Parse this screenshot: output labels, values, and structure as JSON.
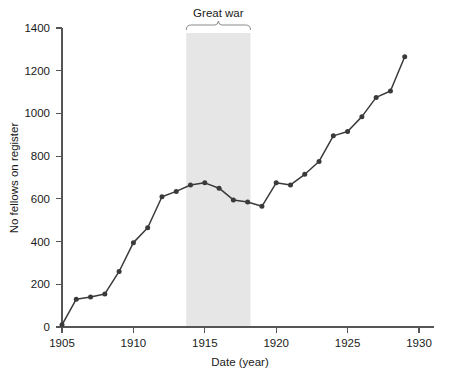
{
  "chart_data": {
    "type": "line",
    "title": "",
    "xlabel": "Date (year)",
    "ylabel": "No fellows on register",
    "xlim": [
      1905,
      1930
    ],
    "ylim": [
      0,
      1400
    ],
    "xticks": [
      1905,
      1910,
      1915,
      1920,
      1925,
      1930
    ],
    "yticks": [
      0,
      200,
      400,
      600,
      800,
      1000,
      1200,
      1400
    ],
    "grid": false,
    "legend": null,
    "x": [
      1905,
      1906,
      1907,
      1908,
      1909,
      1910,
      1911,
      1912,
      1913,
      1914,
      1915,
      1916,
      1917,
      1918,
      1919,
      1920,
      1921,
      1922,
      1923,
      1924,
      1925,
      1926,
      1927,
      1928,
      1929
    ],
    "values": [
      10,
      130,
      140,
      155,
      260,
      395,
      465,
      610,
      635,
      665,
      675,
      650,
      595,
      585,
      565,
      675,
      665,
      715,
      775,
      895,
      915,
      985,
      1075,
      1105,
      1265
    ],
    "marker": "filled-circle",
    "line_color": "#3a3a3a",
    "annotations": [
      {
        "label": "Great war",
        "type": "shaded-band-with-brace",
        "x_start": 1913.7,
        "x_end": 1918.2,
        "band_color": "#e6e6e6"
      }
    ]
  },
  "axis": {
    "y_tick_labels": [
      "0",
      "200",
      "400",
      "600",
      "800",
      "1000",
      "1200",
      "1400"
    ],
    "x_tick_labels": [
      "1905",
      "1910",
      "1915",
      "1920",
      "1925",
      "1930"
    ],
    "x_title": "Date (year)",
    "y_title": "No fellows on register"
  },
  "annotation": {
    "great_war_label": "Great war"
  }
}
